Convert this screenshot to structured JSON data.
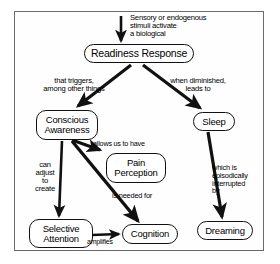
{
  "diagram": {
    "stroke_color": "#111111",
    "frame_color": "#6a6a70",
    "background_color": "#ffffff",
    "nodes": [
      {
        "id": "readiness",
        "label": "Readiness Response",
        "lines": [
          "Readiness Response"
        ]
      },
      {
        "id": "conscious",
        "label": "Conscious Awareness",
        "lines": [
          "Conscious",
          "Awareness"
        ]
      },
      {
        "id": "sleep",
        "label": "Sleep",
        "lines": [
          "Sleep"
        ]
      },
      {
        "id": "pain",
        "label": "Pain Perception",
        "lines": [
          "Pain",
          "Perception"
        ]
      },
      {
        "id": "selective",
        "label": "Selective Attention",
        "lines": [
          "Selective",
          "Attention"
        ]
      },
      {
        "id": "cognition",
        "label": "Cognition",
        "lines": [
          "Cognition"
        ]
      },
      {
        "id": "dreaming",
        "label": "Dreaming",
        "lines": [
          "Dreaming"
        ]
      }
    ],
    "edges": [
      {
        "id": "sensory",
        "from": "input",
        "to": "readiness",
        "label": "Sensory or endogenous stimuli activate a biological",
        "lines": [
          "Sensory or endogenous",
          "stimuli activate",
          "a biological"
        ]
      },
      {
        "id": "triggers",
        "from": "readiness",
        "to": "conscious",
        "label": "that triggers, among other things",
        "lines": [
          "that triggers,",
          "among other things"
        ]
      },
      {
        "id": "diminished",
        "from": "readiness",
        "to": "sleep",
        "label": "when diminished, leads to",
        "lines": [
          "when diminished,",
          "leads to"
        ]
      },
      {
        "id": "allows",
        "from": "conscious",
        "to": "pain",
        "label": "allows us to have",
        "lines": [
          "allows us to have"
        ]
      },
      {
        "id": "can-adjust",
        "from": "conscious",
        "to": "selective",
        "label": "can adjust to create",
        "lines": [
          "can",
          "adjust",
          "to",
          "create"
        ]
      },
      {
        "id": "needed",
        "from": "conscious",
        "to": "cognition",
        "label": "is needed for",
        "lines": [
          "is needed for"
        ]
      },
      {
        "id": "which-is",
        "from": "sleep",
        "to": "dreaming",
        "label": "which is episodically interrupted by",
        "lines": [
          "which is",
          "episodically",
          "interrupted",
          "by"
        ]
      },
      {
        "id": "amplifies",
        "from": "selective",
        "to": "cognition",
        "label": "amplifies",
        "lines": [
          "amplifies"
        ]
      }
    ]
  }
}
